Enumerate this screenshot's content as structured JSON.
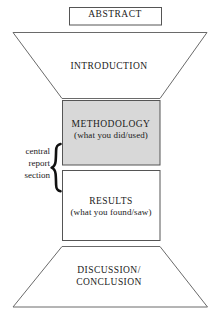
{
  "diagram": {
    "colors": {
      "stroke": "#4d4d4d",
      "methodology_fill": "#d8d8d8",
      "plain_fill": "#ffffff",
      "text": "#1a1a1a"
    },
    "sections": {
      "abstract": {
        "label": "ABSTRACT",
        "shape": "rectangle"
      },
      "introduction": {
        "label": "INTRODUCTION",
        "shape": "inverted-trapezoid"
      },
      "methodology": {
        "label": "METHODOLOGY",
        "sublabel": "(what you did/used)",
        "shape": "rectangle",
        "shaded": "true"
      },
      "results": {
        "label": "RESULTS",
        "sublabel": "(what you found/saw)",
        "shape": "rectangle",
        "shaded": "false"
      },
      "discussion": {
        "label_line1": "DISCUSSION/",
        "label_line2": "CONCLUSION",
        "shape": "trapezoid"
      }
    },
    "annotation": {
      "brace": "{",
      "line1": "central",
      "line2": "report",
      "line3": "section"
    }
  }
}
